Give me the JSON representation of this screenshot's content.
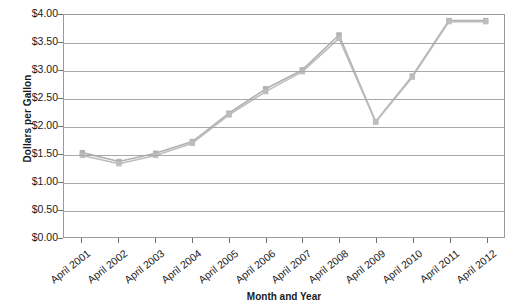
{
  "chart_data": {
    "type": "line",
    "title": "",
    "xlabel": "Month and Year",
    "ylabel": "Dollars per Gallon",
    "categories": [
      "April 2001",
      "April 2002",
      "April 2003",
      "April 2004",
      "April 2005",
      "April 2006",
      "April 2007",
      "April 2008",
      "April 2009",
      "April 2010",
      "April 2011",
      "April 2012"
    ],
    "series": [
      {
        "name": "series-1",
        "color": "#b0b0b0",
        "values": [
          1.52,
          1.36,
          1.51,
          1.72,
          2.23,
          2.67,
          3.01,
          3.64,
          2.08,
          2.9,
          3.9,
          3.9
        ]
      },
      {
        "name": "series-2",
        "color": "#bdbdbd",
        "values": [
          1.47,
          1.32,
          1.47,
          1.69,
          2.2,
          2.62,
          2.98,
          3.58,
          2.07,
          2.88,
          3.88,
          3.88
        ]
      }
    ],
    "ylim": [
      0.0,
      4.0
    ],
    "ytick_values": [
      0.0,
      0.5,
      1.0,
      1.5,
      2.0,
      2.5,
      3.0,
      3.5,
      4.0
    ],
    "ytick_labels": [
      "$0.00",
      "$0.50",
      "$1.00",
      "$1.50",
      "$2.00",
      "$2.50",
      "$3.00",
      "$3.50",
      "$4.00"
    ],
    "grid": true,
    "legend": "none",
    "marker": "square",
    "axis_color": "#9a9a9a",
    "grid_color": "#a8a8a8",
    "text_color": "#1a1a1a"
  }
}
